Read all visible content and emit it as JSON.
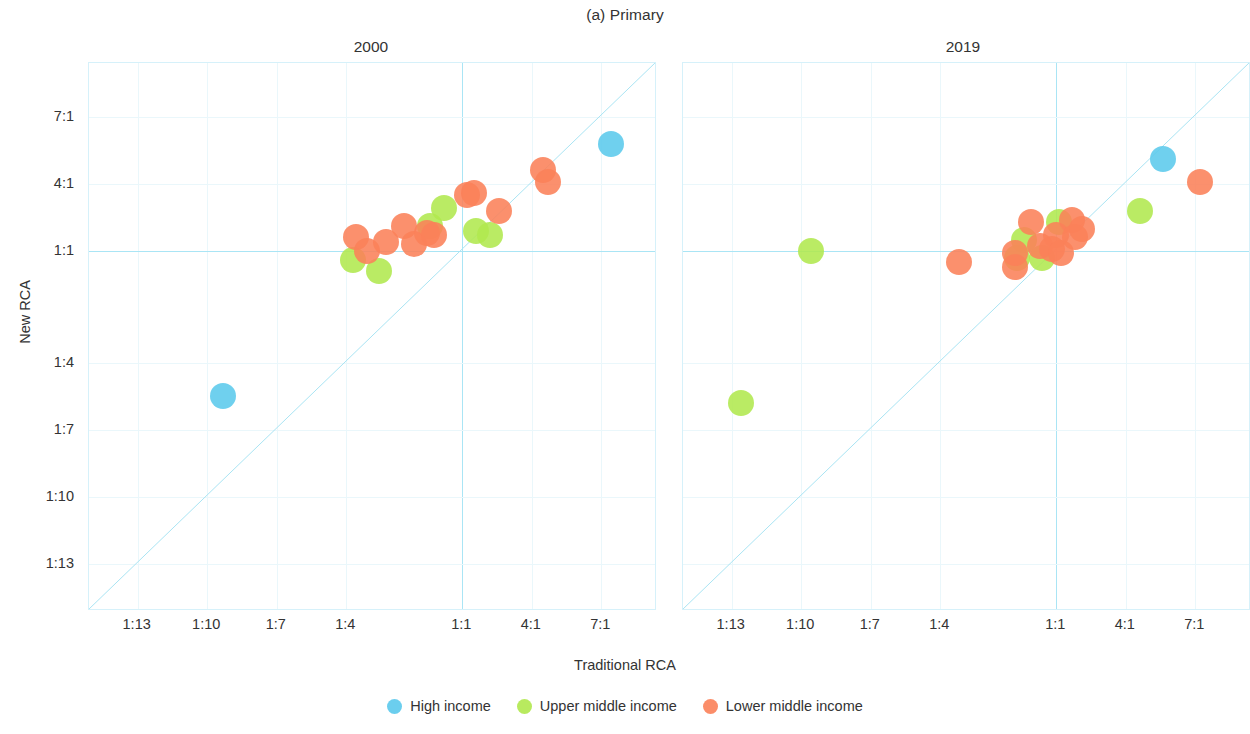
{
  "chart_data": {
    "type": "scatter",
    "title": "(a) Primary",
    "xlabel": "Traditional RCA",
    "ylabel": "New RCA",
    "panels": [
      {
        "label": "2000"
      },
      {
        "label": "2019"
      }
    ],
    "xticks": [
      "1:13",
      "1:10",
      "1:7",
      "1:4",
      "1:1",
      "4:1",
      "7:1"
    ],
    "yticks": [
      "7:1",
      "4:1",
      "1:1",
      "1:4",
      "1:7",
      "1:10",
      "1:13"
    ],
    "xtick_values": [
      -13,
      -10,
      -7,
      -4,
      1,
      4,
      7
    ],
    "ytick_values": [
      7,
      4,
      1,
      -4,
      -7,
      -10,
      -13
    ],
    "xlim": [
      -15.1,
      9.4
    ],
    "ylim": [
      -15.1,
      9.4
    ],
    "grid": true,
    "legend_position": "bottom",
    "reference_line": "y = x (1:1 diagonal)",
    "legend": [
      {
        "name": "High income",
        "color": "#5BC9EC"
      },
      {
        "name": "Upper middle income",
        "color": "#B0E84E"
      },
      {
        "name": "Lower middle income",
        "color": "#FB8159"
      }
    ],
    "series": [
      {
        "name": "High income",
        "color": "#5BC9EC",
        "points_2000": [
          {
            "x": -9.3,
            "y": -5.5
          },
          {
            "x": 7.4,
            "y": 5.8
          }
        ],
        "points_2019": [
          {
            "x": 5.6,
            "y": 5.1
          }
        ]
      },
      {
        "name": "Upper middle income",
        "color": "#B0E84E",
        "points_2000": [
          {
            "x": -3.7,
            "y": 0.6
          },
          {
            "x": -2.6,
            "y": 0.1
          },
          {
            "x": -0.4,
            "y": 2.1
          },
          {
            "x": 0.2,
            "y": 2.9
          },
          {
            "x": 1.6,
            "y": 1.9
          },
          {
            "x": 2.2,
            "y": 1.7
          }
        ],
        "points_2019": [
          {
            "x": -12.6,
            "y": -5.8
          },
          {
            "x": -9.6,
            "y": 1.0
          },
          {
            "x": -0.7,
            "y": 0.7
          },
          {
            "x": -0.4,
            "y": 1.5
          },
          {
            "x": 0.4,
            "y": 0.7
          },
          {
            "x": 1.1,
            "y": 2.3
          },
          {
            "x": 4.6,
            "y": 2.8
          }
        ]
      },
      {
        "name": "Lower middle income",
        "color": "#FB8159",
        "points_2000": [
          {
            "x": -3.6,
            "y": 1.6
          },
          {
            "x": -3.1,
            "y": 1.0
          },
          {
            "x": -2.3,
            "y": 1.4
          },
          {
            "x": -1.5,
            "y": 2.1
          },
          {
            "x": -1.1,
            "y": 1.3
          },
          {
            "x": -0.5,
            "y": 1.8
          },
          {
            "x": -0.2,
            "y": 1.7
          },
          {
            "x": 1.2,
            "y": 3.5
          },
          {
            "x": 1.5,
            "y": 3.6
          },
          {
            "x": 2.6,
            "y": 2.8
          },
          {
            "x": 4.5,
            "y": 4.6
          },
          {
            "x": 4.7,
            "y": 4.1
          }
        ],
        "points_2019": [
          {
            "x": -3.2,
            "y": 0.5
          },
          {
            "x": -0.8,
            "y": 0.3
          },
          {
            "x": -0.8,
            "y": 0.9
          },
          {
            "x": -0.1,
            "y": 2.3
          },
          {
            "x": 0.3,
            "y": 1.2
          },
          {
            "x": 0.8,
            "y": 1.1
          },
          {
            "x": 1.0,
            "y": 1.7
          },
          {
            "x": 1.2,
            "y": 0.9
          },
          {
            "x": 1.7,
            "y": 2.4
          },
          {
            "x": 1.8,
            "y": 1.6
          },
          {
            "x": 2.1,
            "y": 2.0
          },
          {
            "x": 7.2,
            "y": 4.1
          }
        ]
      }
    ]
  }
}
